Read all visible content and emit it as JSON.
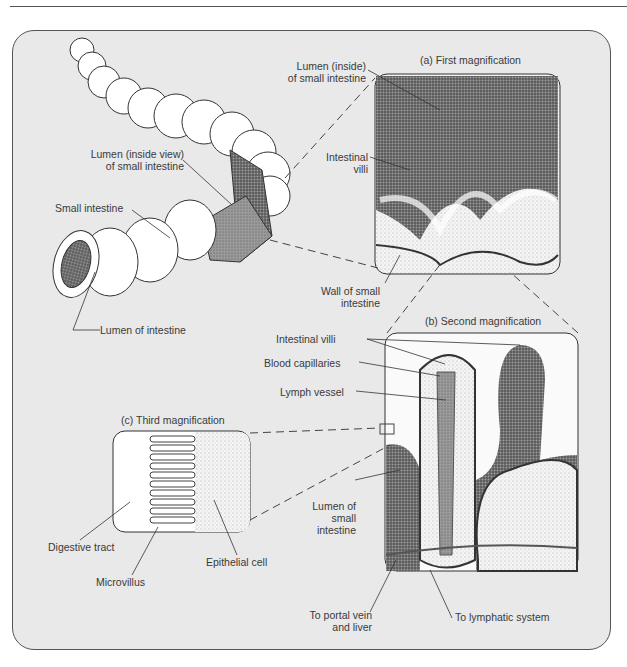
{
  "figure": {
    "panels": {
      "a": {
        "title": "(a) First magnification"
      },
      "b": {
        "title": "(b) Second magnification"
      },
      "c": {
        "title": "(c) Third magnification"
      }
    },
    "labels": {
      "lumen_inside_view_1": "Lumen (inside view)",
      "lumen_inside_view_2": "of small intestine",
      "small_intestine": "Small intestine",
      "lumen_of_intestine": "Lumen of intestine",
      "lumen_inside_1": "Lumen (inside)",
      "lumen_inside_2": "of small intestine",
      "intestinal_villi_a_1": "Intestinal",
      "intestinal_villi_a_2": "villi",
      "wall_1": "Wall of small",
      "wall_2": "intestine",
      "intestinal_villi_b": "Intestinal villi",
      "blood_capillaries": "Blood capillaries",
      "lymph_vessel": "Lymph vessel",
      "lumen_small_1": "Lumen of",
      "lumen_small_2": "small",
      "lumen_small_3": "intestine",
      "digestive_tract": "Digestive tract",
      "microvillus": "Microvillus",
      "epithelial_cell": "Epithelial cell",
      "portal_1": "To portal vein",
      "portal_2": "and liver",
      "lymphatic": "To lymphatic system"
    }
  },
  "colors": {
    "background": "#e9e9e9",
    "frame": "#555555",
    "ink": "#3a3a3a",
    "tissue_dark": "#6e6e6e",
    "tissue_light": "#f3f3f3"
  }
}
